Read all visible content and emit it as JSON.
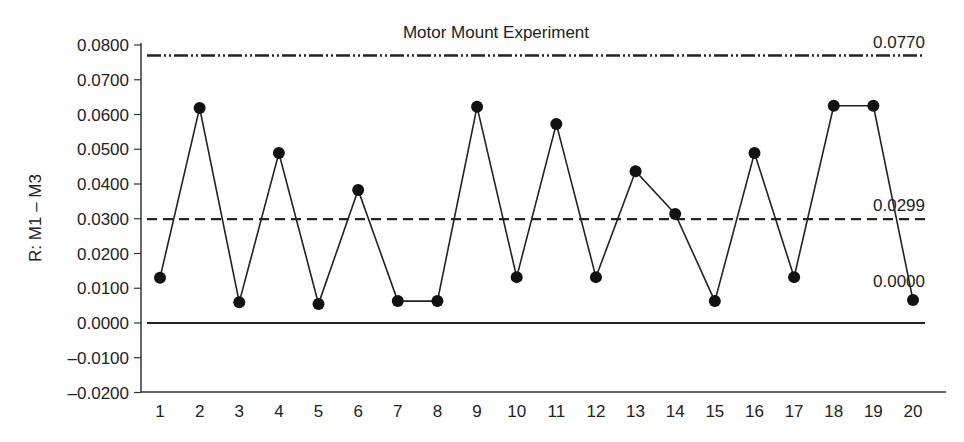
{
  "chart_data": {
    "type": "line",
    "title": "Motor Mount Experiment",
    "xlabel": "",
    "ylabel": "R: M1 – M3",
    "x": [
      1,
      2,
      3,
      4,
      5,
      6,
      7,
      8,
      9,
      10,
      11,
      12,
      13,
      14,
      15,
      16,
      17,
      18,
      19,
      20
    ],
    "series": [
      {
        "name": "Range",
        "values": [
          0.013,
          0.0619,
          0.006,
          0.0489,
          0.0055,
          0.0383,
          0.0063,
          0.0063,
          0.0622,
          0.0132,
          0.0573,
          0.0132,
          0.0437,
          0.0314,
          0.0063,
          0.0489,
          0.0132,
          0.0625,
          0.0625,
          0.0066
        ]
      }
    ],
    "control_limits": {
      "ucl": {
        "value": 0.077,
        "label": "0.0770",
        "style": "dash-dot-dot"
      },
      "center": {
        "value": 0.0299,
        "label": "0.0299",
        "style": "dashed"
      },
      "lcl": {
        "value": 0.0,
        "label": "0.0000",
        "style": "solid"
      }
    },
    "ylim": [
      -0.02,
      0.08
    ],
    "yticks": [
      "0.0800",
      "0.0700",
      "0.0600",
      "0.0500",
      "0.0400",
      "0.0300",
      "0.0200",
      "0.0100",
      "0.0000",
      "–0.0100",
      "–0.0200"
    ],
    "ytick_values": [
      0.08,
      0.07,
      0.06,
      0.05,
      0.04,
      0.03,
      0.02,
      0.01,
      0.0,
      -0.01,
      -0.02
    ],
    "xticks": [
      "1",
      "2",
      "3",
      "4",
      "5",
      "6",
      "7",
      "8",
      "9",
      "10",
      "11",
      "12",
      "13",
      "14",
      "15",
      "16",
      "17",
      "18",
      "19",
      "20"
    ],
    "grid": false,
    "legend": "none"
  }
}
